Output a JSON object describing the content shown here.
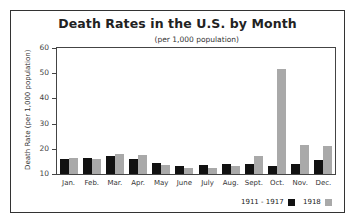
{
  "chart_data": {
    "type": "bar",
    "title": "Death Rates in the U.S. by Month",
    "subtitle": "(per 1,000 population)",
    "xlabel": "",
    "ylabel": "Death Rate (per 1,000 population)",
    "ylim": [
      10,
      60
    ],
    "yticks": [
      10,
      20,
      30,
      40,
      50,
      60
    ],
    "grid": false,
    "legend_position": "bottom-right",
    "categories": [
      "Jan.",
      "Feb.",
      "Mar.",
      "Apr.",
      "May",
      "June",
      "July",
      "Aug.",
      "Sept.",
      "Oct.",
      "Nov.",
      "Dec."
    ],
    "series": [
      {
        "name": "1911 - 1917",
        "color": "#111111",
        "values": [
          16,
          16.5,
          17,
          16,
          14.5,
          13,
          13.5,
          14,
          14,
          13,
          14,
          15.5
        ]
      },
      {
        "name": "1918",
        "color": "#a9a9a9",
        "values": [
          16.5,
          16,
          18,
          17.5,
          13.5,
          12.5,
          12.5,
          13,
          17,
          51.5,
          21.5,
          21
        ]
      }
    ]
  }
}
